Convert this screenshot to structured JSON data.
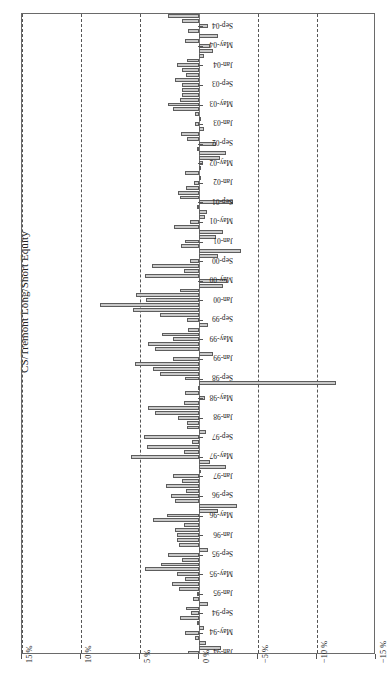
{
  "chart": {
    "title": "CS/Tremont Long/Short Equity",
    "orientation": "rotated-90"
  },
  "chart_data": {
    "type": "bar",
    "title": "CS/Tremont Long/Short Equity",
    "xlabel": "",
    "ylabel": "",
    "grid": true,
    "legend": null,
    "orientation": "horizontal-rotated",
    "value_axis_labels": [
      "15 %",
      "10 %",
      "5 %",
      "0 %",
      "−5 %",
      "−10 %",
      "−15 %"
    ],
    "value_axis_ticks": [
      15,
      10,
      5,
      0,
      -5,
      -10,
      -15
    ],
    "ylim": [
      -15,
      15
    ],
    "category_axis_tick_labels": [
      "Jan-94",
      "May-94",
      "Sep-94",
      "Jan-95",
      "May-95",
      "Sep-95",
      "Jan-96",
      "May-96",
      "Sep-96",
      "Jan-97",
      "May-97",
      "Sep-97",
      "Jan-98",
      "May-98",
      "Sep-98",
      "Jan-99",
      "May-99",
      "Sep-99",
      "Jan-00",
      "May-00",
      "Sep-00",
      "Jan-01",
      "May-01",
      "Sep-01",
      "Jan-02",
      "May-02",
      "Sep-02",
      "Jan-03",
      "May-03",
      "Sep-03",
      "Jan-04",
      "May-04",
      "Sep-04"
    ],
    "categories": [
      "Jan-94",
      "Feb-94",
      "Mar-94",
      "Apr-94",
      "May-94",
      "Jun-94",
      "Jul-94",
      "Aug-94",
      "Sep-94",
      "Oct-94",
      "Nov-94",
      "Dec-94",
      "Jan-95",
      "Feb-95",
      "Mar-95",
      "Apr-95",
      "May-95",
      "Jun-95",
      "Jul-95",
      "Aug-95",
      "Sep-95",
      "Oct-95",
      "Nov-95",
      "Dec-95",
      "Jan-96",
      "Feb-96",
      "Mar-96",
      "Apr-96",
      "May-96",
      "Jun-96",
      "Jul-96",
      "Aug-96",
      "Sep-96",
      "Oct-96",
      "Nov-96",
      "Dec-96",
      "Jan-97",
      "Feb-97",
      "Mar-97",
      "Apr-97",
      "May-97",
      "Jun-97",
      "Jul-97",
      "Aug-97",
      "Sep-97",
      "Oct-97",
      "Nov-97",
      "Dec-97",
      "Jan-98",
      "Feb-98",
      "Mar-98",
      "Apr-98",
      "May-98",
      "Jun-98",
      "Jul-98",
      "Aug-98",
      "Sep-98",
      "Oct-98",
      "Nov-98",
      "Dec-98",
      "Jan-99",
      "Feb-99",
      "Mar-99",
      "Apr-99",
      "May-99",
      "Jun-99",
      "Jul-99",
      "Aug-99",
      "Sep-99",
      "Oct-99",
      "Nov-99",
      "Dec-99",
      "Jan-00",
      "Feb-00",
      "Mar-00",
      "Apr-00",
      "May-00",
      "Jun-00",
      "Jul-00",
      "Aug-00",
      "Sep-00",
      "Oct-00",
      "Nov-00",
      "Dec-00",
      "Jan-01",
      "Feb-01",
      "Mar-01",
      "Apr-01",
      "May-01",
      "Jun-01",
      "Jul-01",
      "Aug-01",
      "Sep-01",
      "Oct-01",
      "Nov-01",
      "Dec-01",
      "Jan-02",
      "Feb-02",
      "Mar-02",
      "Apr-02",
      "May-02",
      "Jun-02",
      "Jul-02",
      "Aug-02",
      "Sep-02",
      "Oct-02",
      "Nov-02",
      "Dec-02",
      "Jan-03",
      "Feb-03",
      "Mar-03",
      "Apr-03",
      "May-03",
      "Jun-03",
      "Jul-03",
      "Aug-03",
      "Sep-03",
      "Oct-03",
      "Nov-03",
      "Dec-03",
      "Jan-04",
      "Feb-04",
      "Mar-04",
      "Apr-04",
      "May-04",
      "Jun-04",
      "Jul-04",
      "Aug-04",
      "Sep-04",
      "Oct-04",
      "Nov-04"
    ],
    "values": [
      0.9,
      -1.9,
      -0.6,
      0.3,
      1.2,
      -0.4,
      0.2,
      1.6,
      0.7,
      1.1,
      -0.8,
      0.5,
      0.2,
      1.7,
      2.3,
      1.2,
      1.9,
      4.6,
      3.2,
      1.4,
      2.6,
      -0.8,
      1.7,
      1.9,
      1.9,
      2.0,
      1.3,
      3.9,
      2.7,
      -1.6,
      -3.2,
      2.0,
      2.4,
      1.1,
      2.8,
      1.4,
      2.2,
      -0.2,
      -2.3,
      -0.9,
      5.8,
      1.3,
      4.4,
      0.6,
      4.7,
      -0.6,
      1.0,
      1.0,
      1.8,
      3.7,
      4.3,
      1.3,
      -0.5,
      1.2,
      0.1,
      -11.6,
      1.2,
      3.3,
      3.9,
      5.4,
      2.2,
      -1.2,
      3.7,
      4.3,
      2.2,
      3.1,
      0.9,
      -0.8,
      1.0,
      3.3,
      5.6,
      8.4,
      4.5,
      5.3,
      1.6,
      -2.0,
      -2.4,
      4.6,
      1.3,
      4.0,
      0.8,
      -1.6,
      -3.6,
      1.5,
      1.2,
      -1.4,
      -2.0,
      2.1,
      0.8,
      -0.5,
      -0.7,
      0.2,
      -2.9,
      1.6,
      1.8,
      1.1,
      0.4,
      0.0,
      1.2,
      0.0,
      -0.3,
      -1.8,
      -2.3,
      0.2,
      -1.4,
      1.0,
      1.5,
      -0.4,
      0.3,
      0.0,
      0.3,
      2.2,
      2.6,
      1.6,
      1.4,
      1.4,
      1.4,
      2.0,
      1.1,
      1.4,
      1.9,
      1.0,
      -0.4,
      -1.2,
      -0.9,
      1.2,
      -1.6,
      0.9,
      -0.8,
      1.4,
      2.6
    ]
  }
}
